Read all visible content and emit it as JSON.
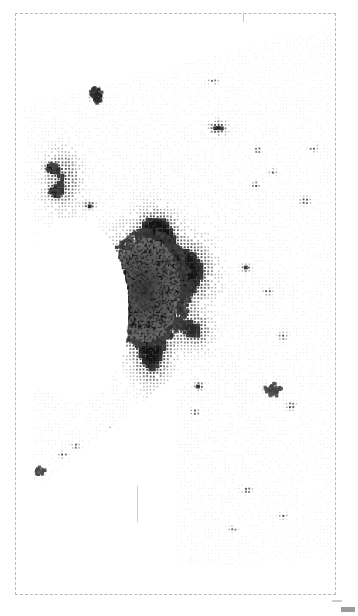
{
  "figure": {
    "type": "dot-density-map",
    "title": "",
    "background_color": "#ffffff",
    "frame": {
      "style": "dashed",
      "color": "#b9b9b9",
      "x": 15,
      "y": 13,
      "width": 321,
      "height": 582
    },
    "tick_mark": {
      "x": 243,
      "y": 13,
      "length": 9,
      "color": "#c9c9c9"
    },
    "artifacts": [
      {
        "name": "vertical-line-artifact",
        "x": 137,
        "y": 486,
        "width": 1,
        "height": 36,
        "color": "#cfcfcf"
      },
      {
        "name": "bottom-right-corner-mark",
        "x": 341,
        "y": 607,
        "width": 14,
        "height": 5,
        "color": "#8a8a8a"
      }
    ]
  },
  "chart_data": {
    "type": "heatmap",
    "title": "",
    "subtitle": "",
    "xlabel": "",
    "ylabel": "",
    "legend": [],
    "grid": false,
    "value_range": [
      0,
      1
    ],
    "colormap": "grays",
    "cell_pitch_px": 3.4,
    "regions": [
      {
        "name": "metropolitan-core",
        "cx": 148,
        "cy": 288,
        "rx": 46,
        "ry": 62,
        "density": 0.9
      },
      {
        "name": "core-inner-dense",
        "cx": 145,
        "cy": 290,
        "rx": 28,
        "ry": 42,
        "density": 0.98
      },
      {
        "name": "core-north-lobe",
        "cx": 158,
        "cy": 232,
        "rx": 20,
        "ry": 22,
        "density": 0.72
      },
      {
        "name": "core-east-lobe",
        "cx": 192,
        "cy": 270,
        "rx": 26,
        "ry": 28,
        "density": 0.62
      },
      {
        "name": "core-south-tail",
        "cx": 152,
        "cy": 356,
        "rx": 20,
        "ry": 32,
        "density": 0.6
      },
      {
        "name": "core-southeast-spur",
        "cx": 196,
        "cy": 330,
        "rx": 18,
        "ry": 18,
        "density": 0.55
      },
      {
        "name": "west-shore-belt",
        "cx": 62,
        "cy": 178,
        "rx": 22,
        "ry": 34,
        "density": 0.66
      },
      {
        "name": "northwest-town-a",
        "cx": 57,
        "cy": 76,
        "rx": 6,
        "ry": 6,
        "density": 0.97
      },
      {
        "name": "northwest-town-b",
        "cx": 96,
        "cy": 95,
        "rx": 7,
        "ry": 9,
        "density": 0.93
      },
      {
        "name": "northwest-town-c",
        "cx": 84,
        "cy": 72,
        "rx": 6,
        "ry": 3,
        "density": 0.8
      },
      {
        "name": "west-town-d",
        "cx": 52,
        "cy": 168,
        "rx": 6,
        "ry": 5,
        "density": 0.88
      },
      {
        "name": "west-town-e",
        "cx": 55,
        "cy": 192,
        "rx": 6,
        "ry": 5,
        "density": 0.9
      },
      {
        "name": "west-town-f",
        "cx": 90,
        "cy": 205,
        "rx": 7,
        "ry": 4,
        "density": 0.75
      },
      {
        "name": "north-town-g",
        "cx": 218,
        "cy": 128,
        "rx": 11,
        "ry": 9,
        "density": 0.78
      },
      {
        "name": "north-town-h",
        "cx": 213,
        "cy": 81,
        "rx": 7,
        "ry": 4,
        "density": 0.55
      },
      {
        "name": "northeast-town-i",
        "cx": 313,
        "cy": 148,
        "rx": 6,
        "ry": 5,
        "density": 0.6
      },
      {
        "name": "east-town-j",
        "cx": 258,
        "cy": 150,
        "rx": 4,
        "ry": 4,
        "density": 0.7
      },
      {
        "name": "east-town-k",
        "cx": 273,
        "cy": 172,
        "rx": 5,
        "ry": 4,
        "density": 0.62
      },
      {
        "name": "east-town-l",
        "cx": 256,
        "cy": 185,
        "rx": 5,
        "ry": 4,
        "density": 0.66
      },
      {
        "name": "east-town-m",
        "cx": 305,
        "cy": 201,
        "rx": 7,
        "ry": 5,
        "density": 0.68
      },
      {
        "name": "east-town-n",
        "cx": 246,
        "cy": 268,
        "rx": 6,
        "ry": 5,
        "density": 0.66
      },
      {
        "name": "east-town-o",
        "cx": 268,
        "cy": 292,
        "rx": 5,
        "ry": 4,
        "density": 0.62
      },
      {
        "name": "southeast-town-p",
        "cx": 283,
        "cy": 336,
        "rx": 6,
        "ry": 5,
        "density": 0.6
      },
      {
        "name": "southeast-town-q",
        "cx": 273,
        "cy": 390,
        "rx": 9,
        "ry": 7,
        "density": 0.86
      },
      {
        "name": "southeast-town-r",
        "cx": 291,
        "cy": 406,
        "rx": 6,
        "ry": 5,
        "density": 0.7
      },
      {
        "name": "south-town-s",
        "cx": 199,
        "cy": 386,
        "rx": 6,
        "ry": 5,
        "density": 0.72
      },
      {
        "name": "south-town-t",
        "cx": 168,
        "cy": 406,
        "rx": 7,
        "ry": 5,
        "density": 0.82
      },
      {
        "name": "south-town-u",
        "cx": 195,
        "cy": 412,
        "rx": 6,
        "ry": 4,
        "density": 0.66
      },
      {
        "name": "south-town-v",
        "cx": 154,
        "cy": 506,
        "rx": 5,
        "ry": 4,
        "density": 0.6
      },
      {
        "name": "south-town-w",
        "cx": 247,
        "cy": 490,
        "rx": 6,
        "ry": 4,
        "density": 0.7
      },
      {
        "name": "south-town-x",
        "cx": 283,
        "cy": 516,
        "rx": 5,
        "ry": 4,
        "density": 0.66
      },
      {
        "name": "south-town-y",
        "cx": 233,
        "cy": 529,
        "rx": 6,
        "ry": 4,
        "density": 0.55
      },
      {
        "name": "southwest-town-z",
        "cx": 40,
        "cy": 471,
        "rx": 6,
        "ry": 5,
        "density": 0.84
      },
      {
        "name": "southwest-town-aa",
        "cx": 63,
        "cy": 455,
        "rx": 6,
        "ry": 4,
        "density": 0.62
      },
      {
        "name": "southwest-town-ab",
        "cx": 76,
        "cy": 446,
        "rx": 5,
        "ry": 4,
        "density": 0.6
      },
      {
        "name": "southwest-town-ac",
        "cx": 112,
        "cy": 430,
        "rx": 5,
        "ry": 4,
        "density": 0.58
      },
      {
        "name": "mid-town-ad",
        "cx": 131,
        "cy": 469,
        "rx": 4,
        "ry": 4,
        "density": 0.62
      },
      {
        "name": "mid-town-ae",
        "cx": 150,
        "cy": 507,
        "rx": 4,
        "ry": 6,
        "density": 0.68
      },
      {
        "name": "north-town-af",
        "cx": 163,
        "cy": 62,
        "rx": 5,
        "ry": 6,
        "density": 0.72
      }
    ],
    "boundary_notes": {
      "north_edge": "slopes downward from upper-right (x~340,y~25) to left (x~60,y~95)",
      "west_void": "large white data gap west/southwest of metropolitan core (x 20-105, y 215-400)",
      "southwest_edge": "straight diagonal from (x~30,y~490) up-right to (x~150,y~395)",
      "south_edge": "irregular, data fades out near y~560",
      "east_edge": "data extends to frame at x~334"
    }
  }
}
